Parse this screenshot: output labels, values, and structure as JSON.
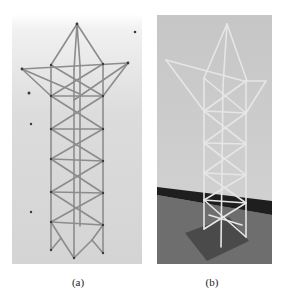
{
  "figure": {
    "panels": [
      {
        "id": "a",
        "caption": "(a)",
        "description": "3D model render of lattice transmission tower with cross-arm",
        "background": "#d8d8d8",
        "member_color": "#8a8a8a",
        "node_color": "#3a3a3a"
      },
      {
        "id": "b",
        "caption": "(b)",
        "description": "Photograph of physical lattice tower model on base plate",
        "wall_color": "#cfcfcf",
        "baseboard_color": "#1e1e1e",
        "floor_color": "#6a6a6a",
        "member_color": "#e4e4e4"
      }
    ]
  }
}
